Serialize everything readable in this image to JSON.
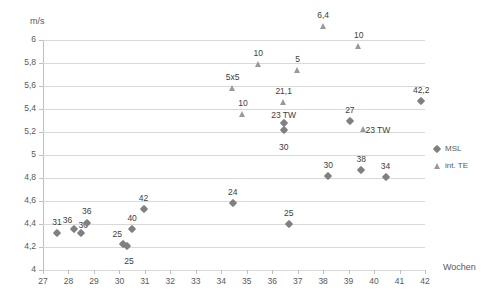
{
  "chart_data": {
    "type": "scatter",
    "title": "",
    "xlabel": "Wochen",
    "ylabel": "m/s",
    "xlim": [
      27,
      42
    ],
    "ylim": [
      4,
      6
    ],
    "grid": true,
    "legend_position": "right",
    "x_ticks": [
      "27",
      "28",
      "29",
      "30",
      "31",
      "32",
      "33",
      "34",
      "35",
      "36",
      "37",
      "38",
      "39",
      "40",
      "41",
      "42"
    ],
    "y_ticks": [
      "4",
      "4,2",
      "4,4",
      "4,6",
      "4,8",
      "5",
      "5,2",
      "5,4",
      "5,6",
      "5,8",
      "6"
    ],
    "series": [
      {
        "name": "MSL",
        "marker": "diamond",
        "color": "#808080",
        "points": [
          {
            "x": 27.55,
            "y": 4.32,
            "label": "31"
          },
          {
            "x": 28.2,
            "y": 4.36,
            "label": "36"
          },
          {
            "x": 28.5,
            "y": 4.32,
            "label": "30"
          },
          {
            "x": 28.72,
            "y": 4.41,
            "label": "36"
          },
          {
            "x": 30.15,
            "y": 4.23,
            "label": "25"
          },
          {
            "x": 30.3,
            "y": 4.21,
            "label": "25"
          },
          {
            "x": 30.5,
            "y": 4.36,
            "label": "40"
          },
          {
            "x": 30.95,
            "y": 4.53,
            "label": "42"
          },
          {
            "x": 34.45,
            "y": 4.58,
            "label": "24"
          },
          {
            "x": 36.65,
            "y": 4.4,
            "label": "25"
          },
          {
            "x": 36.45,
            "y": 5.28,
            "label": "23 TW"
          },
          {
            "x": 36.45,
            "y": 5.22,
            "label": "30"
          },
          {
            "x": 38.2,
            "y": 4.82,
            "label": "30"
          },
          {
            "x": 39.05,
            "y": 5.3,
            "label": "27"
          },
          {
            "x": 39.5,
            "y": 4.87,
            "label": "38"
          },
          {
            "x": 40.45,
            "y": 4.81,
            "label": "34"
          },
          {
            "x": 41.85,
            "y": 5.47,
            "label": "42,2"
          }
        ]
      },
      {
        "name": "int. TE",
        "marker": "triangle",
        "color": "#9a9a9a",
        "points": [
          {
            "x": 34.45,
            "y": 5.58,
            "label": "5x5"
          },
          {
            "x": 34.85,
            "y": 5.36,
            "label": "10"
          },
          {
            "x": 35.45,
            "y": 5.79,
            "label": "10"
          },
          {
            "x": 36.45,
            "y": 5.46,
            "label": "21,1"
          },
          {
            "x": 37.0,
            "y": 5.74,
            "label": "5"
          },
          {
            "x": 38.0,
            "y": 6.12,
            "label": "6,4"
          },
          {
            "x": 39.4,
            "y": 5.95,
            "label": "10"
          },
          {
            "x": 39.6,
            "y": 5.23,
            "label": "23 TW"
          }
        ]
      }
    ],
    "legend": [
      {
        "name": "MSL",
        "marker": "diamond"
      },
      {
        "name": "int. TE",
        "marker": "triangle"
      }
    ]
  }
}
